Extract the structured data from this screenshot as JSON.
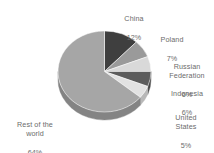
{
  "chart_data": {
    "type": "pie",
    "title": "",
    "subtitle": "",
    "xlabel": "",
    "ylabel": "",
    "legend_position": "none",
    "grid": false,
    "three_d": true,
    "start_angle_deg": 0,
    "direction": "clockwise",
    "categories": [
      "China",
      "Poland",
      "Russian Federation",
      "Indonesia",
      "United States",
      "Rest of the world"
    ],
    "values": [
      12,
      7,
      6,
      6,
      5,
      64
    ],
    "value_suffix": "%",
    "slices": [
      {
        "label": "China",
        "value": 12,
        "value_text": "12%",
        "color": "#3f3f3f",
        "side_color": "#2e2e2e"
      },
      {
        "label": "Poland",
        "value": 7,
        "value_text": "7%",
        "color": "#9a9a9a",
        "side_color": "#7b7b7b"
      },
      {
        "label": "Russian Federation",
        "value": 6,
        "value_text": "6%",
        "color": "#d9d9d9",
        "side_color": "#b0b0b0"
      },
      {
        "label": "Indonesia",
        "value": 6,
        "value_text": "6%",
        "color": "#5c5c5c",
        "side_color": "#474747"
      },
      {
        "label": "United States",
        "value": 5,
        "value_text": "5%",
        "color": "#e2e2e2",
        "side_color": "#b8b8b8"
      },
      {
        "label": "Rest of the world",
        "value": 64,
        "value_text": "64%",
        "color": "#a6a6a6",
        "side_color": "#848484"
      }
    ],
    "labels": [
      {
        "name": "China",
        "value_text": "12%"
      },
      {
        "name": "Poland",
        "value_text": "7%"
      },
      {
        "name": "Russian\nFederation",
        "value_text": "6%"
      },
      {
        "name": "Indonesia",
        "value_text": "6%"
      },
      {
        "name": "United\nStates",
        "value_text": "5%"
      },
      {
        "name": "Rest of the\nworld",
        "value_text": "64%"
      }
    ],
    "colors": {
      "background": "#ffffff",
      "label_text": "#6b6b6b"
    }
  }
}
